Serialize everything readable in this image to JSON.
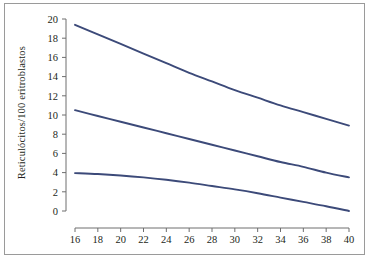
{
  "chart_data": {
    "type": "line",
    "title": "",
    "xlabel": "",
    "ylabel": "Reticulócitos/100 eritroblastos",
    "xlim": [
      16,
      40
    ],
    "ylim": [
      0,
      20
    ],
    "xticks": [
      16,
      18,
      20,
      22,
      24,
      26,
      28,
      30,
      32,
      34,
      36,
      38,
      40
    ],
    "yticks": [
      0,
      2,
      4,
      6,
      8,
      10,
      12,
      14,
      16,
      18,
      20
    ],
    "xtick_labels": [
      "16",
      "18",
      "20",
      "22",
      "24",
      "26",
      "28",
      "30",
      "32",
      "34",
      "36",
      "38",
      "40"
    ],
    "ytick_labels": [
      "0",
      "2",
      "4",
      "6",
      "8",
      "10",
      "12",
      "14",
      "16",
      "18",
      "20"
    ],
    "grid": false,
    "legend": "none",
    "line_color": "#3c4a79",
    "axis_color": "#6e6e6e",
    "frame_color": "#9a9a9a",
    "background": "#ffffff",
    "series": [
      {
        "name": "upper",
        "x": [
          16,
          18,
          20,
          22,
          24,
          26,
          28,
          30,
          32,
          34,
          36,
          38,
          40
        ],
        "values": [
          19.4,
          18.4,
          17.4,
          16.4,
          15.4,
          14.4,
          13.5,
          12.6,
          11.8,
          11.0,
          10.3,
          9.6,
          8.9
        ]
      },
      {
        "name": "median",
        "x": [
          16,
          18,
          20,
          22,
          24,
          26,
          28,
          30,
          32,
          34,
          36,
          38,
          40
        ],
        "values": [
          10.5,
          9.9,
          9.3,
          8.7,
          8.1,
          7.5,
          6.9,
          6.3,
          5.7,
          5.1,
          4.6,
          4.0,
          3.5
        ]
      },
      {
        "name": "lower",
        "x": [
          16,
          18,
          20,
          22,
          24,
          26,
          28,
          30,
          32,
          34,
          36,
          38,
          40
        ],
        "values": [
          3.95,
          3.85,
          3.7,
          3.5,
          3.25,
          2.95,
          2.6,
          2.25,
          1.85,
          1.4,
          0.95,
          0.5,
          0.0
        ]
      }
    ]
  },
  "figure": {
    "y_axis_title": "Reticulócitos/100 eritroblastos"
  }
}
